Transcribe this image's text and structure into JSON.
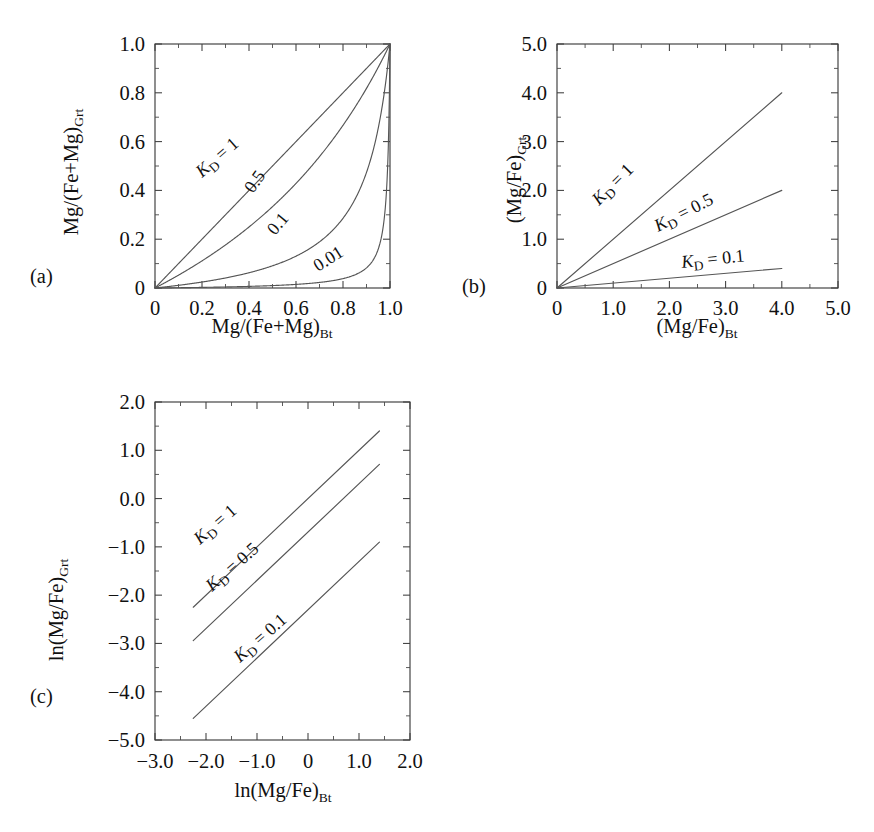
{
  "figure": {
    "background_color": "#ffffff",
    "line_color": "#555555",
    "axis_color": "#3d3d3d",
    "text_color": "#111111"
  },
  "panels": [
    {
      "letter": "(a)",
      "id": "panel-a",
      "xlabel_main": "Mg/(Fe+Mg)",
      "xlabel_sub": "Bt",
      "ylabel_main": "Mg/(Fe+Mg)",
      "ylabel_sub": "Grt",
      "xticks": [
        "0",
        "0.2",
        "0.4",
        "0.6",
        "0.8",
        "1.0"
      ],
      "yticks": [
        "0",
        "0.2",
        "0.4",
        "0.6",
        "0.8",
        "1.0"
      ],
      "xlim": [
        0,
        1
      ],
      "ylim": [
        0,
        1
      ],
      "curve_labels": [
        "K",
        "D",
        " = 1",
        "0.5",
        "0.1",
        "0.01"
      ]
    },
    {
      "letter": "(b)",
      "id": "panel-b",
      "xlabel_main": "(Mg/Fe)",
      "xlabel_sub": "Bt",
      "ylabel_main": "(Mg/Fe)",
      "ylabel_sub": "Grt",
      "xticks": [
        "0",
        "1.0",
        "2.0",
        "3.0",
        "4.0",
        "5.0"
      ],
      "yticks": [
        "0",
        "1.0",
        "2.0",
        "3.0",
        "4.0",
        "5.0"
      ],
      "xlim": [
        0,
        5
      ],
      "ylim": [
        0,
        5
      ]
    },
    {
      "letter": "(c)",
      "id": "panel-c",
      "xlabel_main": "ln(Mg/Fe)",
      "xlabel_sub": "Bt",
      "ylabel_main": "ln(Mg/Fe)",
      "ylabel_sub": "Grt",
      "xticks": [
        "−3.0",
        "−2.0",
        "−1.0",
        "0",
        "1.0",
        "2.0"
      ],
      "yticks": [
        "−5.0",
        "−4.0",
        "−3.0",
        "−2.0",
        "−1.0",
        "0.0",
        "1.0",
        "2.0"
      ],
      "xlim": [
        -3,
        2
      ],
      "ylim": [
        -5,
        2
      ]
    }
  ],
  "chart_data": [
    {
      "type": "line",
      "panel": "(a)",
      "title": "",
      "xlabel": "Mg/(Fe+Mg)_Bt",
      "ylabel": "Mg/(Fe+Mg)_Grt",
      "xlim": [
        0,
        1
      ],
      "ylim": [
        0,
        1
      ],
      "xticks": [
        0,
        0.2,
        0.4,
        0.6,
        0.8,
        1.0
      ],
      "yticks": [
        0,
        0.2,
        0.4,
        0.6,
        0.8,
        1.0
      ],
      "grid": false,
      "legend": "inline-curve-labels",
      "equation": "X_Grt = K_D*X_Bt / (1 - X_Bt + K_D*X_Bt)",
      "series": [
        {
          "name": "K_D = 1",
          "kd": 1,
          "label_text": "K_D = 1",
          "label_rotation_deg": -41,
          "x": [
            0,
            0.1,
            0.2,
            0.3,
            0.4,
            0.5,
            0.6,
            0.7,
            0.8,
            0.9,
            1.0
          ],
          "values": [
            0,
            0.1,
            0.2,
            0.3,
            0.4,
            0.5,
            0.6,
            0.7,
            0.8,
            0.9,
            1.0
          ]
        },
        {
          "name": "K_D = 0.5",
          "kd": 0.5,
          "label_text": "0.5",
          "label_rotation_deg": -55,
          "x": [
            0,
            0.1,
            0.2,
            0.3,
            0.4,
            0.5,
            0.6,
            0.7,
            0.8,
            0.9,
            1.0
          ],
          "values": [
            0,
            0.053,
            0.111,
            0.176,
            0.25,
            0.333,
            0.429,
            0.538,
            0.667,
            0.818,
            1.0
          ]
        },
        {
          "name": "K_D = 0.1",
          "kd": 0.1,
          "label_text": "0.1",
          "label_rotation_deg": -50,
          "x": [
            0,
            0.1,
            0.2,
            0.3,
            0.4,
            0.5,
            0.6,
            0.7,
            0.8,
            0.9,
            0.95,
            1.0
          ],
          "values": [
            0,
            0.011,
            0.024,
            0.041,
            0.063,
            0.091,
            0.13,
            0.189,
            0.286,
            0.474,
            0.655,
            1.0
          ]
        },
        {
          "name": "K_D = 0.01",
          "kd": 0.01,
          "label_text": "0.01",
          "label_rotation_deg": -32,
          "x": [
            0,
            0.2,
            0.4,
            0.6,
            0.8,
            0.9,
            0.95,
            0.98,
            0.99,
            0.995,
            1.0
          ],
          "values": [
            0,
            0.0025,
            0.0066,
            0.0148,
            0.0385,
            0.0826,
            0.1599,
            0.329,
            0.4975,
            0.6653,
            1.0
          ]
        }
      ]
    },
    {
      "type": "line",
      "panel": "(b)",
      "title": "",
      "xlabel": "(Mg/Fe)_Bt",
      "ylabel": "(Mg/Fe)_Grt",
      "xlim": [
        0,
        5
      ],
      "ylim": [
        0,
        5
      ],
      "xticks": [
        0,
        1.0,
        2.0,
        3.0,
        4.0,
        5.0
      ],
      "yticks": [
        0,
        1.0,
        2.0,
        3.0,
        4.0,
        5.0
      ],
      "grid": false,
      "legend": "inline-curve-labels",
      "equation": "(Mg/Fe)_Grt = K_D * (Mg/Fe)_Bt",
      "series": [
        {
          "name": "K_D = 1",
          "kd": 1,
          "label_text": "K_D = 1",
          "label_rotation_deg": -45,
          "x": [
            0,
            4.0
          ],
          "values": [
            0,
            4.0
          ]
        },
        {
          "name": "K_D = 0.5",
          "kd": 0.5,
          "label_text": "K_D = 0.5",
          "label_rotation_deg": -27,
          "x": [
            0,
            4.0
          ],
          "values": [
            0,
            2.0
          ]
        },
        {
          "name": "K_D = 0.1",
          "kd": 0.1,
          "label_text": "K_D = 0.1",
          "label_rotation_deg": -6,
          "x": [
            0,
            4.0
          ],
          "values": [
            0,
            0.4
          ]
        }
      ]
    },
    {
      "type": "line",
      "panel": "(c)",
      "title": "",
      "xlabel": "ln(Mg/Fe)_Bt",
      "ylabel": "ln(Mg/Fe)_Grt",
      "xlim": [
        -3,
        2
      ],
      "ylim": [
        -5,
        2
      ],
      "xticks": [
        -3.0,
        -2.0,
        -1.0,
        0,
        1.0,
        2.0
      ],
      "yticks": [
        -5.0,
        -4.0,
        -3.0,
        -2.0,
        -1.0,
        0.0,
        1.0,
        2.0
      ],
      "grid": false,
      "legend": "inline-curve-labels",
      "equation": "ln(Mg/Fe)_Grt = ln(Mg/Fe)_Bt + ln(K_D)",
      "series": [
        {
          "name": "K_D = 1",
          "kd": 1,
          "intercept": 0.0,
          "label_text": "K_D = 1",
          "label_rotation_deg": -41,
          "x": [
            -2.25,
            1.4
          ],
          "values": [
            -2.25,
            1.4
          ]
        },
        {
          "name": "K_D = 0.5",
          "kd": 0.5,
          "intercept": -0.693,
          "label_text": "K_D = 0.5",
          "label_rotation_deg": -41,
          "x": [
            -2.25,
            1.4
          ],
          "values": [
            -2.943,
            0.707
          ]
        },
        {
          "name": "K_D = 0.1",
          "kd": 0.1,
          "intercept": -2.303,
          "label_text": "K_D = 0.1",
          "label_rotation_deg": -41,
          "x": [
            -2.25,
            1.4
          ],
          "values": [
            -4.553,
            -0.903
          ]
        }
      ]
    }
  ]
}
